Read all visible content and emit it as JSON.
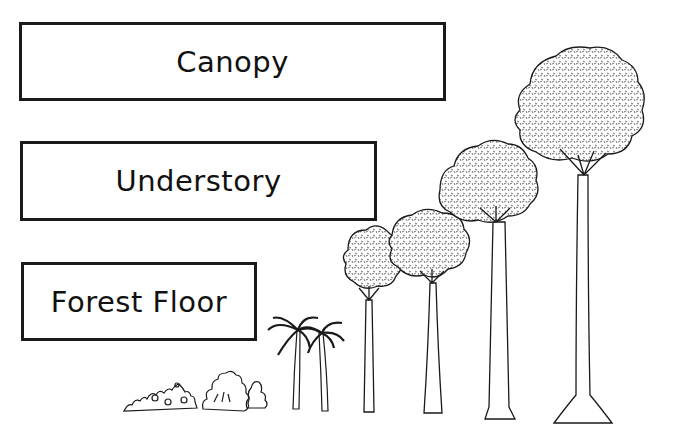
{
  "diagram": {
    "layers": [
      {
        "label": "Canopy"
      },
      {
        "label": "Understory"
      },
      {
        "label": "Forest Floor"
      }
    ],
    "illustrations": [
      {
        "name": "low-shrub",
        "type": "shrub"
      },
      {
        "name": "bush",
        "type": "shrub"
      },
      {
        "name": "palm-tree-1",
        "type": "palm"
      },
      {
        "name": "palm-tree-2",
        "type": "palm"
      },
      {
        "name": "small-tree-1",
        "type": "tree"
      },
      {
        "name": "small-tree-2",
        "type": "tree"
      },
      {
        "name": "medium-tree",
        "type": "tree"
      },
      {
        "name": "tall-emergent-tree",
        "type": "tree"
      }
    ],
    "colors": {
      "line": "#1a1a1a",
      "background": "#ffffff",
      "foliage_fill": "#e8e8e8"
    }
  }
}
